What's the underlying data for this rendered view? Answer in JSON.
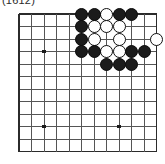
{
  "figure": {
    "caption": "(1612)",
    "kind": "go-board-diagram"
  },
  "board": {
    "name": "go-board",
    "cols": 12,
    "rows": 12,
    "origin_x": 13,
    "origin_y": 6,
    "spacing": 12.5,
    "line_color": "#555555",
    "thick_line_color": "#2b2b2b",
    "background": "#ffffff",
    "edges": {
      "top": true,
      "left": true,
      "right": true,
      "bottom": true
    },
    "star_points": [
      {
        "name": "star-point-upper-left",
        "col": 2,
        "row": 3
      },
      {
        "name": "star-point-lower-left",
        "col": 2,
        "row": 9
      },
      {
        "name": "star-point-lower-right",
        "col": 8,
        "row": 9
      }
    ],
    "star_point_color": "#1b1b1b",
    "stone_colors": {
      "black": "#1b1b1b",
      "white": "#ffffff",
      "outline": "#111111"
    },
    "stones": [
      {
        "color": "black",
        "col": 5,
        "row": 0
      },
      {
        "color": "black",
        "col": 6,
        "row": 0
      },
      {
        "color": "white",
        "col": 7,
        "row": 0
      },
      {
        "color": "black",
        "col": 8,
        "row": 0
      },
      {
        "color": "black",
        "col": 9,
        "row": 0
      },
      {
        "color": "black",
        "col": 5,
        "row": 1
      },
      {
        "color": "white",
        "col": 6,
        "row": 1
      },
      {
        "color": "white",
        "col": 7,
        "row": 1
      },
      {
        "color": "white",
        "col": 8,
        "row": 1
      },
      {
        "color": "black",
        "col": 5,
        "row": 2
      },
      {
        "color": "white",
        "col": 6,
        "row": 2
      },
      {
        "color": "white",
        "col": 8,
        "row": 2
      },
      {
        "color": "white",
        "col": 11,
        "row": 2
      },
      {
        "color": "black",
        "col": 5,
        "row": 3
      },
      {
        "color": "black",
        "col": 6,
        "row": 3
      },
      {
        "color": "white",
        "col": 7,
        "row": 3
      },
      {
        "color": "white",
        "col": 8,
        "row": 3
      },
      {
        "color": "black",
        "col": 9,
        "row": 3
      },
      {
        "color": "black",
        "col": 10,
        "row": 3
      },
      {
        "color": "black",
        "col": 7,
        "row": 4
      },
      {
        "color": "black",
        "col": 8,
        "row": 4
      },
      {
        "color": "black",
        "col": 9,
        "row": 4
      }
    ]
  }
}
